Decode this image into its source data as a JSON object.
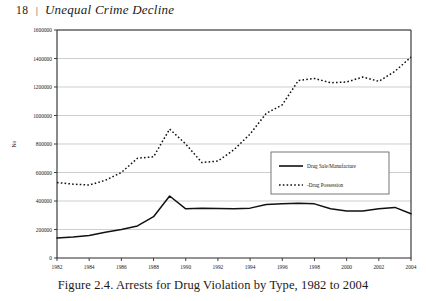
{
  "running_head": {
    "folio": "18",
    "separator": "|",
    "book_title": "Unequal Crime Decline"
  },
  "caption": "Figure 2.4. Arrests for Drug Violation by Type, 1982 to 2004",
  "legend": {
    "position": "inside-right-middle",
    "entries": [
      {
        "label": "Drug Sale/Manufacture",
        "style": "solid"
      },
      {
        "label": "-Drug Possession",
        "style": "dashed"
      }
    ]
  },
  "chart_data": {
    "type": "line",
    "title": "",
    "xlabel": "",
    "ylabel": "No",
    "xlim": [
      1982,
      2004
    ],
    "ylim": [
      0,
      1600000
    ],
    "grid": true,
    "y_ticks": [
      0,
      200000,
      400000,
      600000,
      800000,
      1000000,
      1200000,
      1400000,
      1600000
    ],
    "y_tick_labels": [
      "0",
      "200000",
      "400000",
      "600000",
      "800000",
      "1000000",
      "1200000",
      "1400000",
      "1600000"
    ],
    "x_ticks": [
      1982,
      1984,
      1986,
      1988,
      1990,
      1992,
      1994,
      1996,
      1998,
      2000,
      2002,
      2004
    ],
    "x_tick_labels": [
      "1982",
      "1984",
      "1986",
      "1988",
      "1990",
      "1992",
      "1994",
      "1996",
      "1998",
      "2000",
      "2002",
      "2004"
    ],
    "x": [
      1982,
      1983,
      1984,
      1985,
      1986,
      1987,
      1988,
      1989,
      1990,
      1991,
      1992,
      1993,
      1994,
      1995,
      1996,
      1997,
      1998,
      1999,
      2000,
      2001,
      2002,
      2003,
      2004
    ],
    "series": [
      {
        "name": "Drug Sale/Manufacture",
        "style": "solid",
        "values": [
          140000,
          147000,
          158000,
          180000,
          200000,
          225000,
          290000,
          435000,
          345000,
          350000,
          348000,
          345000,
          350000,
          375000,
          380000,
          385000,
          380000,
          345000,
          330000,
          330000,
          345000,
          355000,
          310000
        ]
      },
      {
        "name": "Drug Possession",
        "style": "dashed",
        "values": [
          530000,
          518000,
          512000,
          545000,
          600000,
          700000,
          710000,
          905000,
          800000,
          670000,
          680000,
          760000,
          870000,
          1015000,
          1075000,
          1245000,
          1260000,
          1230000,
          1235000,
          1270000,
          1240000,
          1310000,
          1410000
        ]
      }
    ]
  }
}
